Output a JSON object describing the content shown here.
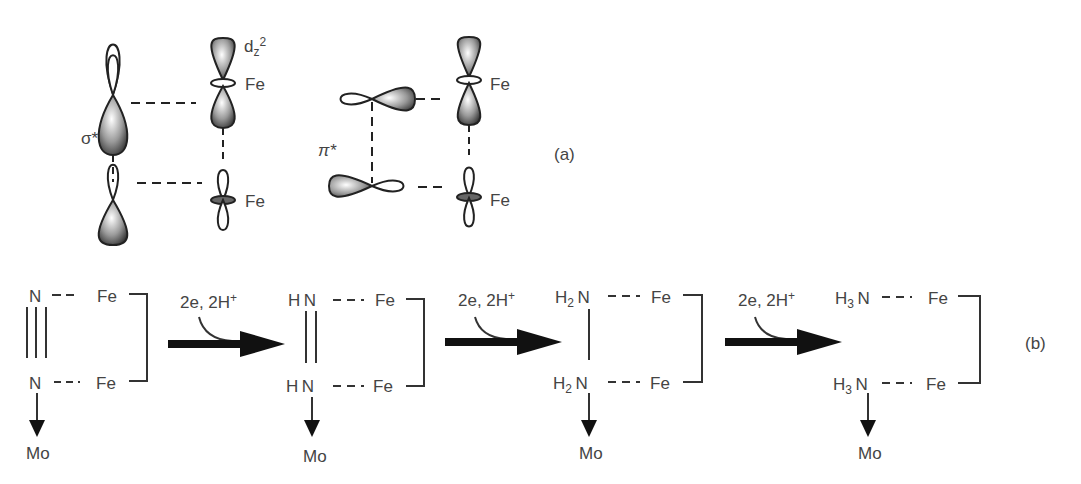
{
  "part_a": {
    "panel_label": "(a)",
    "sigma_star": {
      "label": "σ*"
    },
    "pi_star": {
      "label": "π*"
    },
    "orbital_label": "dz2",
    "orbital_label_main": "d",
    "orbital_label_sub": "z",
    "orbital_label_sup": "2",
    "metal_labels": [
      "Fe",
      "Fe",
      "Fe",
      "Fe"
    ]
  },
  "part_b": {
    "panel_label": "(b)",
    "reagent": "2e, 2H",
    "reagent_charge": "+",
    "steps": [
      {
        "top": {
          "prefix": "",
          "sub": "",
          "atom": "N"
        },
        "bottom": {
          "prefix": "",
          "sub": "",
          "atom": "N"
        },
        "bond": "triple",
        "fe_top": "Fe",
        "fe_bottom": "Fe",
        "mo": "Mo"
      },
      {
        "top": {
          "prefix": "H",
          "sub": "",
          "atom": "N"
        },
        "bottom": {
          "prefix": "H",
          "sub": "",
          "atom": "N"
        },
        "bond": "double",
        "fe_top": "Fe",
        "fe_bottom": "Fe",
        "mo": "Mo"
      },
      {
        "top": {
          "prefix": "H",
          "sub": "2",
          "atom": "N"
        },
        "bottom": {
          "prefix": "H",
          "sub": "2",
          "atom": "N"
        },
        "bond": "single",
        "fe_top": "Fe",
        "fe_bottom": "Fe",
        "mo": "Mo"
      },
      {
        "top": {
          "prefix": "H",
          "sub": "3",
          "atom": "N"
        },
        "bottom": {
          "prefix": "H",
          "sub": "3",
          "atom": "N"
        },
        "bond": "none",
        "fe_top": "Fe",
        "fe_bottom": "Fe",
        "mo": "Mo"
      }
    ]
  }
}
